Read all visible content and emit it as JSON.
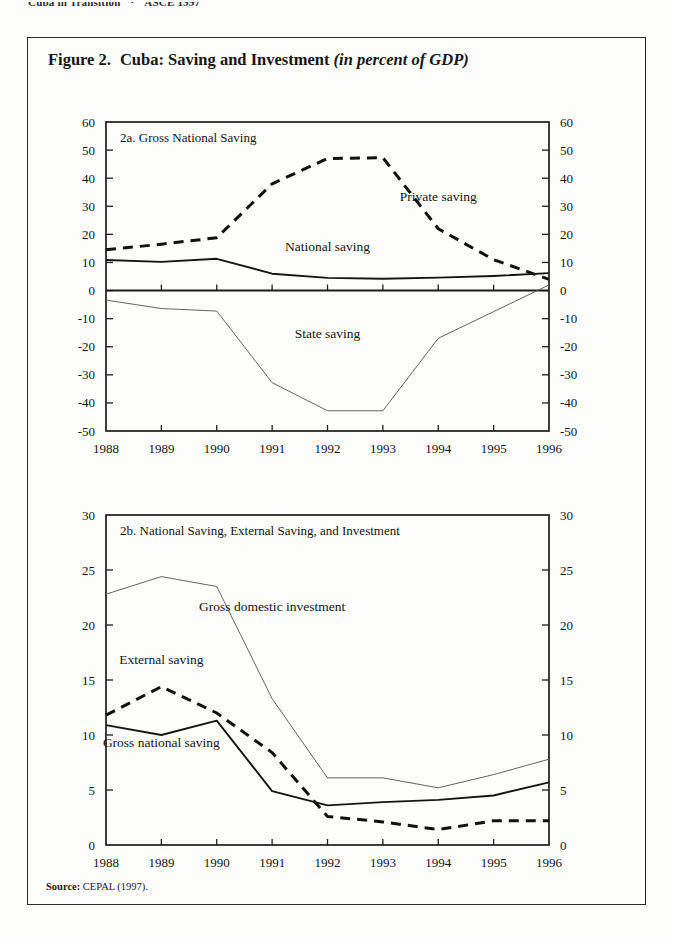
{
  "running_head": {
    "left": "Cuba in Transition",
    "separator": "·",
    "right": "ASCE 1997"
  },
  "figure": {
    "number": "Figure 2.",
    "title_main": "Cuba: Saving and Investment",
    "title_italic": "(in percent of GDP)",
    "source_label": "Source:",
    "source_text": "CEPAL (1997)."
  },
  "chart_data": [
    {
      "type": "line",
      "id": "panel-2a",
      "title": "2a.  Gross National Saving",
      "xlabel": "",
      "ylabel": "",
      "x": [
        "1988",
        "1989",
        "1990",
        "1991",
        "1992",
        "1993",
        "1994",
        "1995",
        "1996"
      ],
      "ylim": [
        -50,
        60
      ],
      "yticks": [
        60,
        50,
        40,
        30,
        20,
        10,
        0,
        -10,
        -20,
        -30,
        -40,
        -50
      ],
      "ytick_labels": [
        "60",
        "50",
        "40",
        "30",
        "20",
        "10",
        "0",
        "-10",
        "-20",
        "-30",
        "-40",
        "-50"
      ],
      "grid": false,
      "legend": "inline-annotations",
      "series": [
        {
          "name": "Private saving",
          "style": "dashed-bold",
          "label_x": "1994",
          "label_y": 32,
          "values": [
            14.5,
            16.5,
            18.8,
            38.0,
            47.0,
            47.3,
            22.0,
            11.0,
            4.0
          ]
        },
        {
          "name": "National saving",
          "style": "solid",
          "label_x": "1992",
          "label_y": 14,
          "values": [
            10.9,
            10.2,
            11.3,
            6.0,
            4.5,
            4.2,
            4.6,
            5.2,
            6.2
          ]
        },
        {
          "name": "State saving",
          "style": "thin",
          "label_x": "1992",
          "label_y": -17,
          "values": [
            -3.4,
            -6.4,
            -7.3,
            -32.8,
            -42.8,
            -42.8,
            -17.0,
            -7.5,
            2.0
          ]
        }
      ]
    },
    {
      "type": "line",
      "id": "panel-2b",
      "title": "2b. National Saving, External Saving, and Investment",
      "xlabel": "",
      "ylabel": "",
      "x": [
        "1988",
        "1989",
        "1990",
        "1991",
        "1992",
        "1993",
        "1994",
        "1995",
        "1996"
      ],
      "ylim": [
        0,
        30
      ],
      "yticks": [
        30,
        25,
        20,
        15,
        10,
        5,
        0
      ],
      "ytick_labels": [
        "30",
        "25",
        "20",
        "15",
        "10",
        "5",
        "0"
      ],
      "grid": false,
      "legend": "inline-annotations",
      "series": [
        {
          "name": "Gross domestic investment",
          "style": "thin",
          "label_x": "1991",
          "label_y": 21.3,
          "values": [
            22.8,
            24.4,
            23.5,
            13.3,
            6.1,
            6.1,
            5.2,
            6.4,
            7.8
          ]
        },
        {
          "name": "External saving",
          "style": "dashed-bold",
          "label_x": "1989",
          "label_y": 16.5,
          "values": [
            11.8,
            14.4,
            12.0,
            8.4,
            2.6,
            2.1,
            1.4,
            2.2,
            2.2
          ]
        },
        {
          "name": "Gross national saving",
          "style": "solid",
          "label_x": "1989",
          "label_y": 8.9,
          "values": [
            10.9,
            10.0,
            11.3,
            4.9,
            3.6,
            3.9,
            4.1,
            4.5,
            5.7
          ]
        }
      ]
    }
  ]
}
